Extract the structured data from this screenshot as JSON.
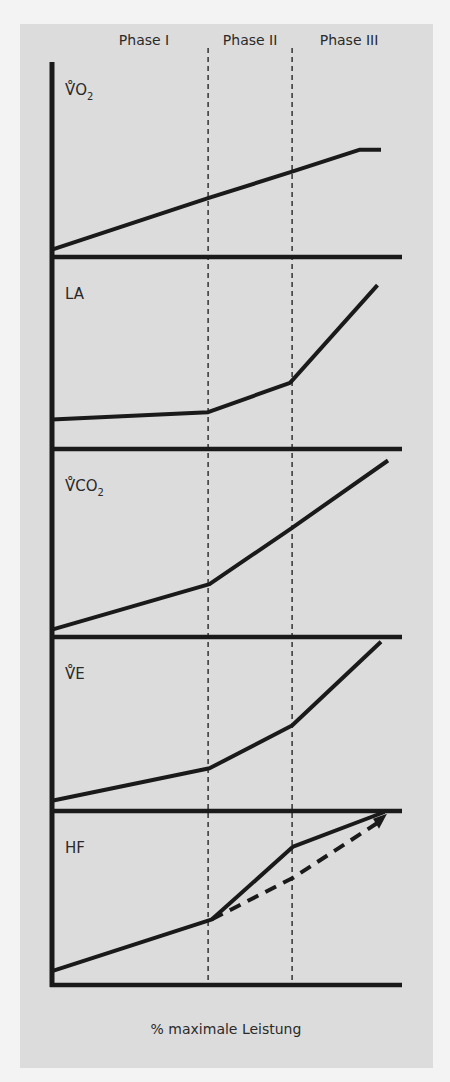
{
  "chart_data": {
    "type": "line",
    "title": "",
    "xlabel": "% maximale Leistung",
    "xlim": [
      0,
      100
    ],
    "phases": [
      {
        "label": "Phase I",
        "from": 0,
        "to": 44.6
      },
      {
        "label": "Phase II",
        "from": 44.6,
        "to": 68.6
      },
      {
        "label": "Phase III",
        "from": 68.6,
        "to": 100
      }
    ],
    "phase_boundaries": [
      44.6,
      68.6
    ],
    "panels": [
      {
        "label": "V̊O",
        "sub": "2",
        "ylim": [
          0,
          1
        ],
        "series": [
          {
            "name": "VO2",
            "style": "solid",
            "points": [
              [
                0,
                0.05
              ],
              [
                44.6,
                0.4
              ],
              [
                68.6,
                0.58
              ],
              [
                88,
                0.73
              ],
              [
                94,
                0.73
              ]
            ]
          }
        ]
      },
      {
        "label": "LA",
        "sub": "",
        "ylim": [
          0,
          1
        ],
        "series": [
          {
            "name": "LA",
            "style": "solid",
            "points": [
              [
                0,
                0.16
              ],
              [
                44.6,
                0.2
              ],
              [
                68,
                0.36
              ],
              [
                93,
                0.89
              ]
            ]
          }
        ]
      },
      {
        "label": "V̊CO",
        "sub": "2",
        "ylim": [
          0,
          1
        ],
        "series": [
          {
            "name": "VCO2",
            "style": "solid",
            "points": [
              [
                0,
                0.04
              ],
              [
                45,
                0.29
              ],
              [
                68.6,
                0.6
              ],
              [
                96,
                0.97
              ]
            ]
          }
        ]
      },
      {
        "label": "V̊E",
        "sub": "",
        "ylim": [
          0,
          1
        ],
        "series": [
          {
            "name": "VE",
            "style": "solid",
            "points": [
              [
                0,
                0.06
              ],
              [
                45,
                0.25
              ],
              [
                68.6,
                0.5
              ],
              [
                94,
                0.99
              ]
            ]
          }
        ]
      },
      {
        "label": "HF",
        "sub": "",
        "ylim": [
          0,
          1
        ],
        "series": [
          {
            "name": "HF",
            "style": "solid",
            "points": [
              [
                0,
                0.08
              ],
              [
                45.7,
                0.38
              ],
              [
                68.9,
                0.8
              ],
              [
                95,
                1.0
              ]
            ]
          },
          {
            "name": "HF linear",
            "style": "dashed",
            "points": [
              [
                45.7,
                0.38
              ],
              [
                68.9,
                0.62
              ],
              [
                94,
                0.95
              ]
            ]
          }
        ]
      }
    ]
  }
}
